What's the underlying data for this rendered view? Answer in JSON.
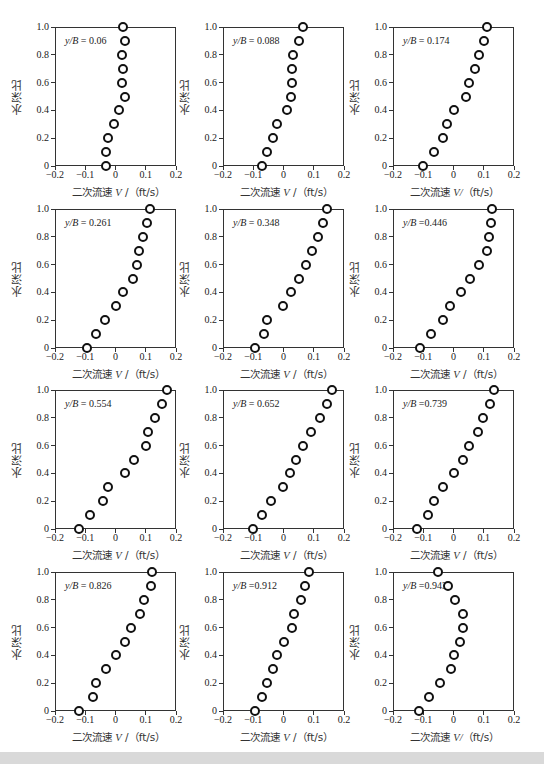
{
  "chart_data": {
    "type": "scatter",
    "layout": "4x3 grid of small multiples",
    "shared": {
      "xlabel": "二次流速 V /（ft/s）",
      "ylabel": "水深比",
      "xlim": [
        -0.2,
        0.2
      ],
      "ylim": [
        0,
        1.0
      ],
      "xticks": [
        "−0.2",
        "−0.1",
        "0",
        "0.1",
        "0.2"
      ],
      "yticks": [
        "0",
        "0.2",
        "0.4",
        "0.6",
        "0.8",
        "1.0"
      ],
      "y": [
        0,
        0.1,
        0.2,
        0.3,
        0.4,
        0.5,
        0.6,
        0.7,
        0.8,
        0.9,
        1.0
      ],
      "marker": "open circle",
      "grid": false,
      "legend": "none"
    },
    "panels": [
      {
        "annotation": "y/B = 0.06",
        "x": [
          -0.03,
          -0.03,
          -0.025,
          -0.005,
          0.01,
          0.03,
          0.02,
          0.025,
          0.02,
          0.03,
          0.025
        ]
      },
      {
        "annotation": "y/B = 0.088",
        "x": [
          -0.07,
          -0.055,
          -0.035,
          -0.02,
          0.01,
          0.025,
          0.027,
          0.028,
          0.03,
          0.05,
          0.065
        ]
      },
      {
        "annotation": "y/B = 0.174",
        "x": [
          -0.1,
          -0.065,
          -0.035,
          -0.02,
          0.003,
          0.04,
          0.052,
          0.07,
          0.085,
          0.1,
          0.11
        ]
      },
      {
        "annotation": "y/B = 0.261",
        "x": [
          -0.095,
          -0.065,
          -0.035,
          0.003,
          0.025,
          0.058,
          0.07,
          0.078,
          0.09,
          0.105,
          0.113
        ]
      },
      {
        "annotation": "y/B = 0.348",
        "x": [
          -0.095,
          -0.065,
          -0.055,
          -0.002,
          0.025,
          0.052,
          0.075,
          0.095,
          0.115,
          0.13,
          0.145
        ]
      },
      {
        "annotation": "y/B =0.446",
        "x": [
          -0.11,
          -0.075,
          -0.035,
          -0.01,
          0.025,
          0.055,
          0.083,
          0.11,
          0.118,
          0.123,
          0.128
        ]
      },
      {
        "annotation": "y/B = 0.554",
        "x": [
          -0.12,
          -0.085,
          -0.04,
          -0.025,
          0.03,
          0.06,
          0.1,
          0.108,
          0.13,
          0.155,
          0.17
        ]
      },
      {
        "annotation": "y/B = 0.652",
        "x": [
          -0.1,
          -0.07,
          -0.04,
          -0.002,
          0.02,
          0.04,
          0.065,
          0.09,
          0.12,
          0.145,
          0.16
        ]
      },
      {
        "annotation": "y/B =0.739",
        "x": [
          -0.12,
          -0.085,
          -0.065,
          -0.035,
          0.003,
          0.032,
          0.05,
          0.08,
          0.098,
          0.12,
          0.133
        ]
      },
      {
        "annotation": "y/B = 0.826",
        "x": [
          -0.12,
          -0.075,
          -0.065,
          -0.03,
          0.003,
          0.03,
          0.05,
          0.08,
          0.095,
          0.117,
          0.12
        ]
      },
      {
        "annotation": "y/B =0.912",
        "x": [
          -0.093,
          -0.072,
          -0.055,
          -0.035,
          -0.02,
          0.003,
          0.028,
          0.035,
          0.057,
          0.07,
          0.085
        ]
      },
      {
        "annotation": "y/B =0.943",
        "x": [
          -0.113,
          -0.08,
          -0.045,
          -0.008,
          0.0,
          0.022,
          0.03,
          0.03,
          0.005,
          -0.018,
          -0.05
        ]
      }
    ]
  },
  "labels": {
    "ylabel": "水深比",
    "xlabel_prefix": "二次流速 ",
    "xlabel_var": "V",
    "xlabel_suffix": " /（ft/s）",
    "xlabel_var_alt": "V/",
    "xlabel_suffix_alt": "（ft/s）"
  }
}
